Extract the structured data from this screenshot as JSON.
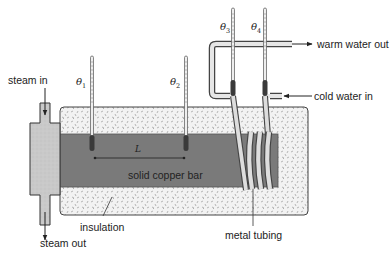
{
  "diagram": {
    "type": "apparatus",
    "labels": {
      "steam_in": "steam in",
      "steam_out": "steam out",
      "insulation": "insulation",
      "solid_copper_bar": "solid copper bar",
      "metal_tubing": "metal tubing",
      "warm_water_out": "warm water out",
      "cold_water_in": "cold water in",
      "length": "L"
    },
    "thermometers": [
      {
        "symbol": "θ",
        "sub": "1"
      },
      {
        "symbol": "θ",
        "sub": "2"
      },
      {
        "symbol": "θ",
        "sub": "3"
      },
      {
        "symbol": "θ",
        "sub": "4"
      }
    ],
    "colors": {
      "copper_bar": "#7a7a7a",
      "insulation": "#f1f1f1",
      "steam_chamber": "#c8c8c8",
      "outline": "#333333",
      "tubing": "#d9d9d9"
    }
  }
}
